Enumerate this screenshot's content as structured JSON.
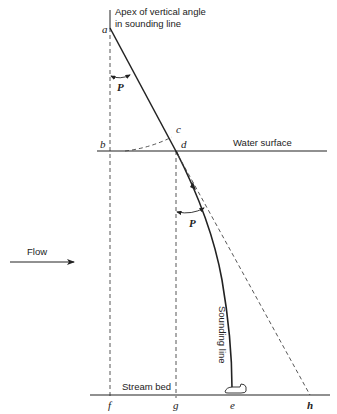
{
  "figure": {
    "title_annotation_line1": "Apex of vertical angle",
    "title_annotation_line2": "in sounding line",
    "water_surface_label": "Water surface",
    "stream_bed_label": "Stream bed",
    "sounding_line_label": "Sounding line",
    "flow_label": "Flow",
    "angle_label_upper": "P",
    "angle_label_lower": "P",
    "points": {
      "a": "a",
      "b": "b",
      "c": "c",
      "d": "d",
      "e": "e",
      "f": "f",
      "g": "g",
      "h": "h"
    }
  },
  "colors": {
    "line": "#222222",
    "background": "#ffffff"
  }
}
